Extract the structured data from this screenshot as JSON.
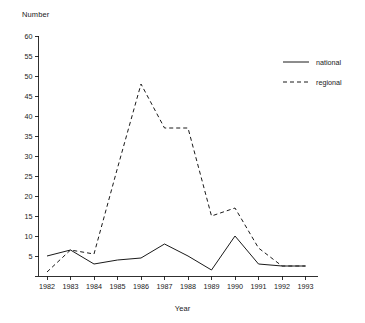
{
  "chart_data": {
    "type": "line",
    "title": "",
    "ylabel": "Number",
    "xlabel": "Year",
    "categories": [
      "1982",
      "1983",
      "1984",
      "1985",
      "1986",
      "1987",
      "1988",
      "1989",
      "1990",
      "1991",
      "1992",
      "1993"
    ],
    "x": [
      1982,
      1983,
      1984,
      1985,
      1986,
      1987,
      1988,
      1989,
      1990,
      1991,
      1992,
      1993
    ],
    "series": [
      {
        "name": "national",
        "style": "solid",
        "values": [
          5,
          6.5,
          3,
          4,
          4.5,
          8,
          5,
          1.5,
          10,
          3,
          2.5,
          2.5
        ]
      },
      {
        "name": "regional",
        "style": "dashed",
        "values": [
          1,
          6.5,
          5.5,
          27,
          48,
          37,
          37,
          15,
          17,
          7,
          2.5,
          2.5
        ]
      }
    ],
    "ylim": [
      0,
      60
    ],
    "yticks": [
      0,
      5,
      10,
      15,
      20,
      25,
      30,
      35,
      40,
      45,
      50,
      55,
      60
    ],
    "ytick_labels": [
      "",
      "5",
      "10",
      "15",
      "20",
      "25",
      "30",
      "35",
      "40",
      "45",
      "50",
      "55",
      "60"
    ],
    "grid": false,
    "legend_position": "top-right"
  },
  "legend": {
    "entries": [
      {
        "label": "national",
        "style": "solid"
      },
      {
        "label": "regional",
        "style": "dashed"
      }
    ]
  }
}
